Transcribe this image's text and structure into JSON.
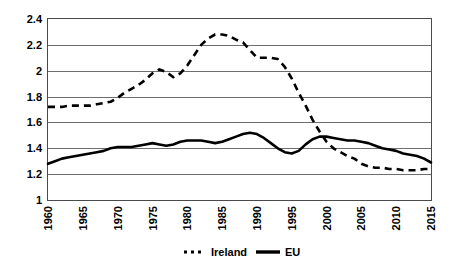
{
  "chart_data": {
    "type": "line",
    "title": "",
    "subtitle": "",
    "xlabel": "",
    "ylabel": "",
    "xlim": [
      1960,
      2015
    ],
    "ylim": [
      1,
      2.4
    ],
    "grid": true,
    "legend_position": "bottom-center",
    "y_ticks": [
      "1",
      "1.2",
      "1.4",
      "1.6",
      "1.8",
      "2",
      "2.2",
      "2.4"
    ],
    "y_tick_values": [
      1,
      1.2,
      1.4,
      1.6,
      1.8,
      2,
      2.2,
      2.4
    ],
    "x_ticks": [
      "1960",
      "1965",
      "1970",
      "1975",
      "1980",
      "1985",
      "1990",
      "1995",
      "2000",
      "2005",
      "2010",
      "2015"
    ],
    "x_tick_values": [
      1960,
      1965,
      1970,
      1975,
      1980,
      1985,
      1990,
      1995,
      2000,
      2005,
      2010,
      2015
    ],
    "x": [
      1960,
      1961,
      1962,
      1963,
      1964,
      1965,
      1966,
      1967,
      1968,
      1969,
      1970,
      1971,
      1972,
      1973,
      1974,
      1975,
      1976,
      1977,
      1978,
      1979,
      1980,
      1981,
      1982,
      1983,
      1984,
      1985,
      1986,
      1987,
      1988,
      1989,
      1990,
      1991,
      1992,
      1993,
      1994,
      1995,
      1996,
      1997,
      1998,
      1999,
      2000,
      2001,
      2002,
      2003,
      2004,
      2005,
      2006,
      2007,
      2008,
      2009,
      2010,
      2011,
      2012,
      2013,
      2014,
      2015
    ],
    "series": [
      {
        "name": "Ireland",
        "style": "dashed",
        "color": "#000000",
        "values": [
          1.72,
          1.72,
          1.72,
          1.73,
          1.73,
          1.73,
          1.73,
          1.74,
          1.75,
          1.76,
          1.79,
          1.83,
          1.86,
          1.89,
          1.93,
          1.98,
          2.01,
          1.99,
          1.95,
          1.98,
          2.04,
          2.12,
          2.2,
          2.25,
          2.28,
          2.28,
          2.27,
          2.24,
          2.22,
          2.16,
          2.1,
          2.1,
          2.1,
          2.09,
          2.03,
          1.94,
          1.83,
          1.73,
          1.62,
          1.53,
          1.45,
          1.4,
          1.37,
          1.34,
          1.32,
          1.28,
          1.26,
          1.25,
          1.25,
          1.24,
          1.24,
          1.23,
          1.23,
          1.23,
          1.24,
          1.24
        ]
      },
      {
        "name": "EU",
        "style": "solid",
        "color": "#000000",
        "values": [
          1.28,
          1.3,
          1.32,
          1.33,
          1.34,
          1.35,
          1.36,
          1.37,
          1.38,
          1.4,
          1.41,
          1.41,
          1.41,
          1.42,
          1.43,
          1.44,
          1.43,
          1.42,
          1.43,
          1.45,
          1.46,
          1.46,
          1.46,
          1.45,
          1.44,
          1.45,
          1.47,
          1.49,
          1.51,
          1.52,
          1.51,
          1.48,
          1.44,
          1.4,
          1.37,
          1.36,
          1.38,
          1.43,
          1.47,
          1.49,
          1.49,
          1.48,
          1.47,
          1.46,
          1.46,
          1.45,
          1.44,
          1.42,
          1.4,
          1.39,
          1.38,
          1.36,
          1.35,
          1.34,
          1.32,
          1.29
        ]
      }
    ]
  },
  "legend": {
    "items": [
      {
        "label": "Ireland",
        "style": "dashed"
      },
      {
        "label": "EU",
        "style": "solid"
      }
    ]
  }
}
